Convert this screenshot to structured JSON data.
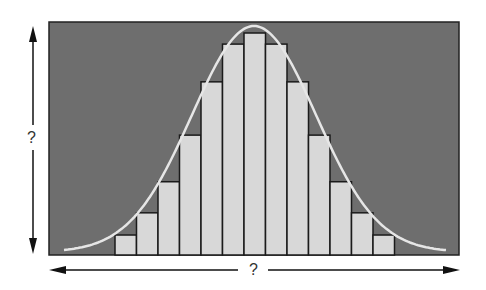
{
  "diagram": {
    "y_axis_label": "?",
    "x_axis_label": "?",
    "colors": {
      "panel": "#6e6e6e",
      "bar_fill": "#d8d8d8",
      "bar_stroke": "#1a1a1a",
      "curve": "#e6e6e6",
      "arrow": "#111111"
    }
  },
  "chart_data": {
    "type": "bar",
    "title": "",
    "xlabel": "?",
    "ylabel": "?",
    "categories": [
      "1",
      "2",
      "3",
      "4",
      "5",
      "6",
      "7",
      "8",
      "9",
      "10",
      "11",
      "12",
      "13"
    ],
    "values": [
      9,
      19,
      33,
      54,
      78,
      95,
      100,
      95,
      78,
      54,
      33,
      19,
      9
    ],
    "overlay": "normal distribution curve",
    "grid": false,
    "legend": "none"
  }
}
